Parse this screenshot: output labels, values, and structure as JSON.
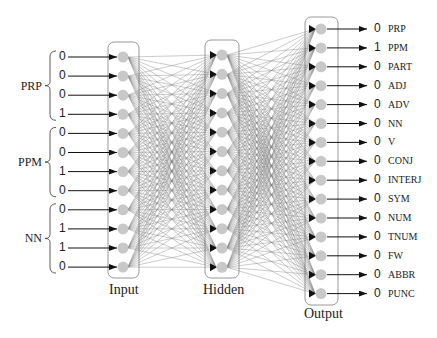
{
  "layers": {
    "input": {
      "title": "Input",
      "x": 123,
      "box": [
        108,
        42,
        31,
        236
      ],
      "nodes": 12,
      "y0": 57,
      "dy": 19.1
    },
    "hidden": {
      "title": "Hidden",
      "x": 222,
      "box": [
        205,
        40,
        34,
        238
      ],
      "nodes": 12,
      "y0": 55,
      "dy": 19.3
    },
    "output": {
      "title": "Output",
      "x": 321,
      "box": [
        305,
        17,
        33,
        288
      ],
      "nodes": 15,
      "y0": 29,
      "dy": 18.9
    }
  },
  "input_groups": [
    {
      "label": "PRP",
      "values": [
        "0",
        "0",
        "0",
        "1"
      ]
    },
    {
      "label": "PPM",
      "values": [
        "0",
        "0",
        "1",
        "0"
      ]
    },
    {
      "label": "NN",
      "values": [
        "0",
        "1",
        "1",
        "0"
      ]
    }
  ],
  "outputs": [
    {
      "value": "0",
      "tag": "PRP"
    },
    {
      "value": "1",
      "tag": "PPM"
    },
    {
      "value": "0",
      "tag": "PART"
    },
    {
      "value": "0",
      "tag": "ADJ"
    },
    {
      "value": "0",
      "tag": "ADV"
    },
    {
      "value": "0",
      "tag": "NN"
    },
    {
      "value": "0",
      "tag": "V"
    },
    {
      "value": "0",
      "tag": "CONJ"
    },
    {
      "value": "0",
      "tag": "INTERJ"
    },
    {
      "value": "0",
      "tag": "SYM"
    },
    {
      "value": "0",
      "tag": "NUM"
    },
    {
      "value": "0",
      "tag": "TNUM"
    },
    {
      "value": "0",
      "tag": "FW"
    },
    {
      "value": "0",
      "tag": "ABBR"
    },
    {
      "value": "0",
      "tag": "PUNC"
    }
  ],
  "colors": {
    "node": "#c8c8c8",
    "edge": "#555555",
    "box": "#999999",
    "arrow": "#111111"
  }
}
